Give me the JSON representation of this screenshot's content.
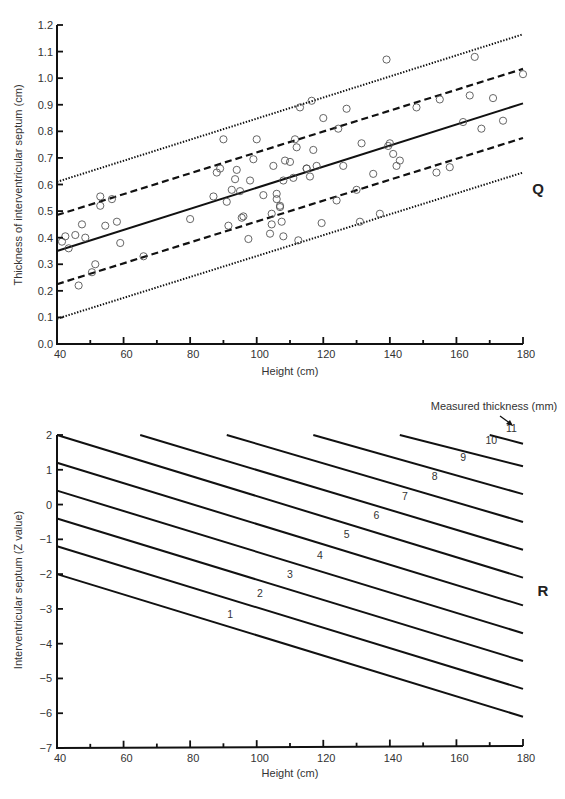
{
  "chart_data": [
    {
      "panel": "Q",
      "type": "scatter",
      "title": "",
      "xlabel": "Height (cm)",
      "ylabel": "Thickness of interventricular septum (cm)",
      "xlim": [
        40,
        180
      ],
      "ylim": [
        0.0,
        1.2
      ],
      "x_ticks": [
        "40",
        "60",
        "80",
        "100",
        "120",
        "140",
        "160",
        "180"
      ],
      "y_ticks": [
        "0.0",
        "0.1",
        "0.2",
        "0.3",
        "0.4",
        "0.5",
        "0.6",
        "0.7",
        "0.8",
        "0.9",
        "1.0",
        "1.1",
        "1.2"
      ],
      "grid": false,
      "series": [
        {
          "name": "regression",
          "style": "solid",
          "x": [
            40,
            180
          ],
          "y": [
            0.35,
            0.905
          ]
        },
        {
          "name": "upper-1",
          "style": "dashed",
          "x": [
            40,
            180
          ],
          "y": [
            0.485,
            1.035
          ]
        },
        {
          "name": "lower-1",
          "style": "dashed",
          "x": [
            40,
            180
          ],
          "y": [
            0.225,
            0.775
          ]
        },
        {
          "name": "upper-2",
          "style": "dotted",
          "x": [
            40,
            180
          ],
          "y": [
            0.61,
            1.165
          ]
        },
        {
          "name": "lower-2",
          "style": "dotted",
          "x": [
            40,
            180
          ],
          "y": [
            0.095,
            0.645
          ]
        }
      ],
      "points": [
        [
          41.5,
          0.385
        ],
        [
          42.5,
          0.405
        ],
        [
          43.5,
          0.36
        ],
        [
          45.5,
          0.41
        ],
        [
          46.5,
          0.22
        ],
        [
          47.5,
          0.45
        ],
        [
          48.5,
          0.4
        ],
        [
          50.5,
          0.27
        ],
        [
          51.5,
          0.3
        ],
        [
          53,
          0.52
        ],
        [
          53,
          0.555
        ],
        [
          54.5,
          0.445
        ],
        [
          56.5,
          0.545
        ],
        [
          58,
          0.46
        ],
        [
          59,
          0.38
        ],
        [
          66,
          0.33
        ],
        [
          80,
          0.47
        ],
        [
          87,
          0.555
        ],
        [
          88,
          0.645
        ],
        [
          89,
          0.66
        ],
        [
          90,
          0.77
        ],
        [
          91,
          0.535
        ],
        [
          91.5,
          0.445
        ],
        [
          92.5,
          0.58
        ],
        [
          93.5,
          0.62
        ],
        [
          94,
          0.655
        ],
        [
          95,
          0.575
        ],
        [
          95.5,
          0.475
        ],
        [
          96,
          0.48
        ],
        [
          97.5,
          0.395
        ],
        [
          98,
          0.615
        ],
        [
          99,
          0.695
        ],
        [
          100,
          0.77
        ],
        [
          102,
          0.56
        ],
        [
          104,
          0.415
        ],
        [
          104.5,
          0.45
        ],
        [
          104.5,
          0.49
        ],
        [
          105,
          0.67
        ],
        [
          106,
          0.545
        ],
        [
          106,
          0.565
        ],
        [
          107,
          0.515
        ],
        [
          107,
          0.52
        ],
        [
          107.5,
          0.46
        ],
        [
          108,
          0.615
        ],
        [
          108,
          0.405
        ],
        [
          108.5,
          0.69
        ],
        [
          110,
          0.685
        ],
        [
          111,
          0.625
        ],
        [
          111.5,
          0.77
        ],
        [
          112,
          0.74
        ],
        [
          112.5,
          0.39
        ],
        [
          113,
          0.89
        ],
        [
          115,
          0.66
        ],
        [
          115,
          0.66
        ],
        [
          116,
          0.63
        ],
        [
          116.5,
          0.915
        ],
        [
          117,
          0.73
        ],
        [
          118,
          0.67
        ],
        [
          119.5,
          0.455
        ],
        [
          120,
          0.85
        ],
        [
          124,
          0.54
        ],
        [
          124.5,
          0.81
        ],
        [
          126,
          0.67
        ],
        [
          127,
          0.885
        ],
        [
          130,
          0.58
        ],
        [
          131,
          0.46
        ],
        [
          131.5,
          0.755
        ],
        [
          135,
          0.64
        ],
        [
          137,
          0.49
        ],
        [
          139,
          1.07
        ],
        [
          139.5,
          0.745
        ],
        [
          140,
          0.755
        ],
        [
          141,
          0.715
        ],
        [
          142,
          0.67
        ],
        [
          143,
          0.69
        ],
        [
          148,
          0.89
        ],
        [
          154,
          0.645
        ],
        [
          155,
          0.92
        ],
        [
          158,
          0.665
        ],
        [
          162,
          0.835
        ],
        [
          164,
          0.935
        ],
        [
          165.5,
          1.08
        ],
        [
          167.5,
          0.81
        ],
        [
          171,
          0.925
        ],
        [
          174,
          0.84
        ],
        [
          180,
          1.015
        ]
      ]
    },
    {
      "panel": "R",
      "type": "line",
      "title": "",
      "xlabel": "Height (cm)",
      "ylabel": "Interventricular septum (Z value)",
      "xlim": [
        40,
        180
      ],
      "ylim": [
        -7,
        2
      ],
      "x_ticks": [
        "40",
        "60",
        "80",
        "100",
        "120",
        "140",
        "160",
        "180"
      ],
      "y_ticks": [
        "2",
        "1",
        "0",
        "−1",
        "−2",
        "−3",
        "−4",
        "−5",
        "−6",
        "−7"
      ],
      "grid": false,
      "annotation": "Measured thickness (mm)",
      "series": [
        {
          "name": "1",
          "x": [
            40,
            180
          ],
          "y": [
            -2.0,
            -6.1
          ],
          "label_at": [
            92,
            -3.4
          ]
        },
        {
          "name": "2",
          "x": [
            40,
            180
          ],
          "y": [
            -1.2,
            -5.3
          ],
          "label_at": [
            101,
            -2.8
          ]
        },
        {
          "name": "3",
          "x": [
            40,
            180
          ],
          "y": [
            -0.4,
            -4.5
          ],
          "label_at": [
            110,
            -2.25
          ]
        },
        {
          "name": "4",
          "x": [
            40,
            180
          ],
          "y": [
            0.4,
            -3.7
          ],
          "label_at": [
            119,
            -1.7
          ]
        },
        {
          "name": "5",
          "x": [
            40,
            180
          ],
          "y": [
            1.2,
            -2.9
          ],
          "label_at": [
            127,
            -1.1
          ]
        },
        {
          "name": "6",
          "x": [
            40,
            180
          ],
          "y": [
            2.0,
            -2.1
          ],
          "label_at": [
            136,
            -0.55
          ]
        },
        {
          "name": "7",
          "x": [
            65,
            180
          ],
          "y": [
            2.0,
            -1.3
          ],
          "label_at": [
            144.5,
            0.0
          ]
        },
        {
          "name": "8",
          "x": [
            91,
            180
          ],
          "y": [
            2.0,
            -0.5
          ],
          "label_at": [
            153.5,
            0.55
          ]
        },
        {
          "name": "9",
          "x": [
            117,
            180
          ],
          "y": [
            2.0,
            0.3
          ],
          "label_at": [
            162,
            1.1
          ]
        },
        {
          "name": "10",
          "x": [
            143,
            180
          ],
          "y": [
            2.0,
            1.1
          ],
          "label_at": [
            170.5,
            1.6
          ]
        },
        {
          "name": "11",
          "x": [
            170,
            180
          ],
          "y": [
            2.0,
            1.75
          ],
          "label_at": [
            176.5,
            1.95
          ]
        }
      ]
    }
  ],
  "panels": {
    "q": {
      "letter": "Q",
      "xlabel": "Height (cm)",
      "ylabel": "Thickness of interventricular septum (cm)",
      "x_ticks": [
        "40",
        "60",
        "80",
        "100",
        "120",
        "140",
        "160",
        "180"
      ],
      "y_ticks": [
        "0.0",
        "0.1",
        "0.2",
        "0.3",
        "0.4",
        "0.5",
        "0.6",
        "0.7",
        "0.8",
        "0.9",
        "1.0",
        "1.1",
        "1.2"
      ]
    },
    "r": {
      "letter": "R",
      "xlabel": "Height (cm)",
      "ylabel": "Interventricular septum (Z value)",
      "annotation": "Measured thickness (mm)",
      "x_ticks": [
        "40",
        "60",
        "80",
        "100",
        "120",
        "140",
        "160",
        "180"
      ],
      "y_ticks": [
        "2",
        "1",
        "0",
        "−1",
        "−2",
        "−3",
        "−4",
        "−5",
        "−6",
        "−7"
      ]
    }
  },
  "colors": {
    "ink": "#111111",
    "text": "#333333",
    "marker": "#555555",
    "background": "#ffffff"
  }
}
